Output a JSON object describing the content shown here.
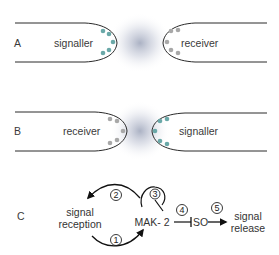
{
  "panels": {
    "A": {
      "letter": "A",
      "left_cell": "signaller",
      "right_cell": "receiver"
    },
    "B": {
      "letter": "B",
      "left_cell": "receiver",
      "right_cell": "signaller"
    },
    "C": {
      "letter": "C",
      "signal_reception_line1": "signal",
      "signal_reception_line2": "reception",
      "mak2": "MAK- 2",
      "so": "SO",
      "signal_release_line1": "signal",
      "signal_release_line2": "release",
      "steps": [
        "1",
        "2",
        "3",
        "4",
        "5"
      ]
    }
  },
  "colors": {
    "signaller_dots": "#6aa8a8",
    "receiver_dots": "#a8a8a8",
    "halo": "#9aa3b8",
    "outline": "#2a2a2a"
  }
}
